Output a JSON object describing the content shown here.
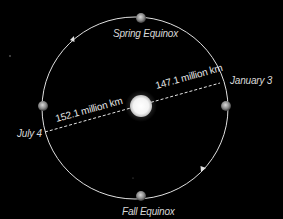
{
  "diagram": {
    "background": "#000000",
    "orbit": {
      "shape": "ellipse",
      "color": "#e0e0e0",
      "direction": "counter-clockwise"
    },
    "sun": {
      "label": "Sun",
      "color": "#ffffff"
    },
    "positions": {
      "spring_equinox": "Spring Equinox",
      "fall_equinox": "Fall Equinox",
      "perihelion": "January 3",
      "aphelion": "July 4"
    },
    "distances": {
      "perihelion_distance": "147.1 million km",
      "aphelion_distance": "152.1 million km"
    },
    "earth_markers": [
      "top",
      "bottom",
      "left",
      "right"
    ]
  }
}
